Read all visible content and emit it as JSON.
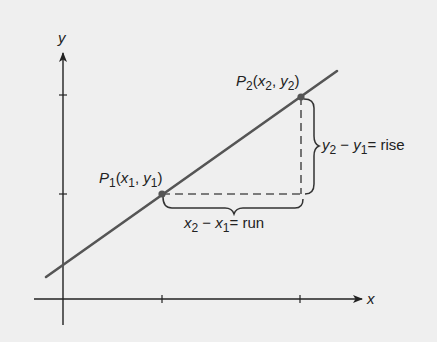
{
  "diagram": {
    "axes": {
      "x_label": "x",
      "y_label": "y"
    },
    "points": [
      {
        "name": "P1",
        "label_main": "P",
        "label_sub": "1",
        "coords": "(x1, y1)",
        "px": [
          162,
          194
        ]
      },
      {
        "name": "P2",
        "label_main": "P",
        "label_sub": "2",
        "coords": "(x2, y2)",
        "px": [
          301,
          97
        ]
      }
    ],
    "labels": {
      "p1": {
        "P": "P",
        "sub": "1",
        "open": "(",
        "x": "x",
        "xsub": "1",
        "comma": ", ",
        "y": "y",
        "ysub": "1",
        "close": ")"
      },
      "p2": {
        "P": "P",
        "sub": "2",
        "open": "(",
        "x": "x",
        "xsub": "2",
        "comma": ", ",
        "y": "y",
        "ysub": "2",
        "close": ")"
      },
      "rise": {
        "a": "y",
        "asub": "2",
        "minus": " − ",
        "b": "y",
        "bsub": "1",
        "eq": "= rise"
      },
      "run": {
        "a": "x",
        "asub": "2",
        "minus": " − ",
        "b": "x",
        "bsub": "1",
        "eq": "= run"
      }
    },
    "colors": {
      "line": "#555555",
      "axis": "#222222",
      "point": "#555555",
      "dash": "#555555",
      "background": "#efefef"
    }
  }
}
